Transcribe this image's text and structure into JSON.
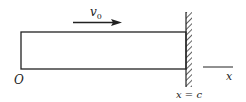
{
  "diagram": {
    "velocity_label": "v",
    "velocity_subscript": "0",
    "origin_label": "O",
    "axis_label": "x",
    "wall_label": "x = c",
    "colors": {
      "stroke": "#222222",
      "background": "#ffffff"
    }
  }
}
